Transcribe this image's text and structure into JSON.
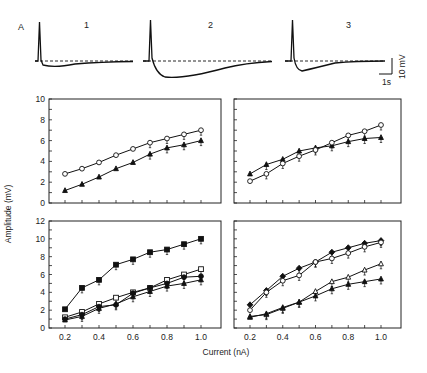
{
  "figure": {
    "panel_label": "A",
    "traces": [
      {
        "label": "1"
      },
      {
        "label": "2"
      },
      {
        "label": "3"
      }
    ],
    "scale_bar": {
      "voltage": "10 mV",
      "time": "1s"
    },
    "ylabel": "Amplitude (mV)",
    "xlabel": "Current (nA)"
  },
  "chart_data": [
    {
      "type": "line",
      "panel": "top-left",
      "x": [
        0.2,
        0.3,
        0.4,
        0.5,
        0.6,
        0.7,
        0.8,
        0.9,
        1.0
      ],
      "series": [
        {
          "name": "open circles",
          "marker": "circle-open",
          "values": [
            2.8,
            3.3,
            3.9,
            4.6,
            5.2,
            5.8,
            6.2,
            6.6,
            7.0
          ]
        },
        {
          "name": "filled triangles",
          "marker": "triangle-filled",
          "values": [
            1.2,
            1.8,
            2.5,
            3.3,
            3.9,
            4.7,
            5.3,
            5.6,
            6.0
          ]
        }
      ],
      "ylim": [
        0,
        10
      ],
      "yticks": [
        0,
        2,
        4,
        6,
        8,
        10
      ],
      "ylabel": "Amplitude (mV)",
      "xlabel": "Current (nA)"
    },
    {
      "type": "line",
      "panel": "top-right",
      "x": [
        0.2,
        0.3,
        0.4,
        0.5,
        0.6,
        0.7,
        0.8,
        0.9,
        1.0
      ],
      "series": [
        {
          "name": "filled triangles",
          "marker": "triangle-filled",
          "values": [
            2.8,
            3.7,
            4.2,
            5.0,
            5.3,
            5.5,
            5.9,
            6.2,
            6.3
          ]
        },
        {
          "name": "open circles",
          "marker": "circle-open",
          "values": [
            2.1,
            2.8,
            3.8,
            4.5,
            5.1,
            5.8,
            6.5,
            6.9,
            7.5
          ]
        }
      ],
      "ylim": [
        0,
        10
      ]
    },
    {
      "type": "line",
      "panel": "bottom-left",
      "x": [
        0.2,
        0.3,
        0.4,
        0.5,
        0.6,
        0.7,
        0.8,
        0.9,
        1.0
      ],
      "series": [
        {
          "name": "filled squares",
          "marker": "square-filled",
          "values": [
            2.1,
            4.5,
            5.4,
            7.1,
            7.7,
            8.5,
            8.8,
            9.4,
            10.0
          ]
        },
        {
          "name": "open squares",
          "marker": "square-open",
          "values": [
            1.2,
            1.8,
            2.7,
            3.4,
            4.0,
            4.5,
            5.4,
            6.0,
            6.6
          ]
        },
        {
          "name": "filled circles",
          "marker": "circle-filled",
          "values": [
            1.0,
            1.5,
            2.4,
            2.6,
            3.9,
            4.5,
            5.0,
            5.7,
            5.8
          ]
        },
        {
          "name": "filled triangles",
          "marker": "triangle-filled",
          "values": [
            0.9,
            1.3,
            2.2,
            2.7,
            3.5,
            4.1,
            4.7,
            5.0,
            5.4
          ]
        }
      ],
      "ylim": [
        0,
        12
      ],
      "yticks": [
        0,
        2,
        4,
        6,
        8,
        10,
        12
      ],
      "xticks": [
        "0.2",
        "0.4",
        "0.6",
        "0.8",
        "1.0"
      ]
    },
    {
      "type": "line",
      "panel": "bottom-right",
      "x": [
        0.2,
        0.3,
        0.4,
        0.5,
        0.6,
        0.7,
        0.8,
        0.9,
        1.0
      ],
      "series": [
        {
          "name": "filled diamonds",
          "marker": "diamond-filled",
          "values": [
            2.6,
            4.2,
            5.8,
            6.7,
            7.4,
            8.5,
            9.0,
            9.5,
            9.8
          ]
        },
        {
          "name": "open circles",
          "marker": "circle-open",
          "values": [
            2.0,
            4.0,
            5.3,
            5.9,
            7.4,
            7.8,
            8.4,
            9.1,
            9.6
          ]
        },
        {
          "name": "open triangles",
          "marker": "triangle-open",
          "values": [
            1.3,
            1.5,
            2.2,
            2.9,
            4.1,
            5.2,
            5.7,
            6.5,
            7.2
          ]
        },
        {
          "name": "filled triangles",
          "marker": "triangle-filled",
          "values": [
            1.2,
            1.6,
            2.3,
            2.9,
            3.6,
            4.4,
            4.9,
            5.2,
            5.5
          ]
        }
      ],
      "ylim": [
        0,
        12
      ],
      "xticks": [
        "0.2",
        "0.4",
        "0.6",
        "0.8",
        "1.0"
      ]
    }
  ]
}
